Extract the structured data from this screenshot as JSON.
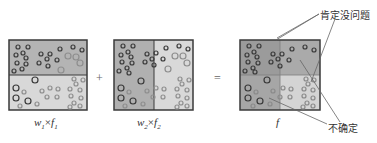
{
  "diagram": {
    "panels": [
      {
        "id": "panel1",
        "caption_w": "w",
        "caption_w_sub": "1",
        "caption_times": "×",
        "caption_f": "f",
        "caption_f_sub": "1",
        "split": "horizontal"
      },
      {
        "id": "panel2",
        "caption_w": "w",
        "caption_w_sub": "2",
        "caption_times": "×",
        "caption_f": "f",
        "caption_f_sub": "2",
        "split": "vertical"
      },
      {
        "id": "panel3",
        "caption_f": "f",
        "split": "quadrant"
      }
    ],
    "operators": {
      "plus": "+",
      "equals": "="
    },
    "annotations": {
      "certain": "肯定没问题",
      "uncertain": "不确定"
    },
    "colors": {
      "dark_region": "#a9a9a9",
      "light_region": "#d6d6d6",
      "darkest_region": "#8f8f8f",
      "border": "#3a3a3a",
      "circle_dark": "#333333",
      "circle_light": "#9a9a9a",
      "leader_line": "#666666"
    }
  }
}
